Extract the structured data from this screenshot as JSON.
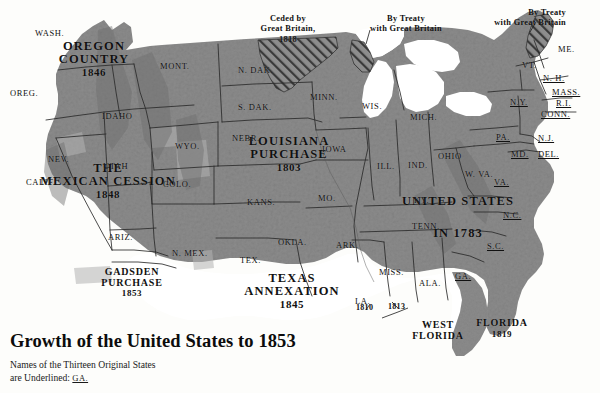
{
  "title": "Growth of the United States to 1853",
  "legend": {
    "line1": "Names of the Thirteen Original States",
    "line2_prefix": "are Underlined:",
    "line2_example": "GA."
  },
  "colors": {
    "land": "#8d8d8d",
    "land_light": "#b0b0b0",
    "water": "#ffffff",
    "paper": "#fdfdfb",
    "border": "#2b2b2b",
    "text": "#111111"
  },
  "territories": [
    {
      "name": "OREGON COUNTRY",
      "line1": "OREGON",
      "line2": "COUNTRY",
      "year": "1846"
    },
    {
      "name": "THE MEXICAN CESSION",
      "line1": "THE",
      "line2": "MEXICAN CESSION",
      "year": "1848"
    },
    {
      "name": "GADSDEN PURCHASE",
      "line1": "GADSDEN",
      "line2": "PURCHASE",
      "year": "1853"
    },
    {
      "name": "LOUISIANA PURCHASE",
      "line1": "LOUISIANA",
      "line2": "PURCHASE",
      "year": "1803"
    },
    {
      "name": "TEXAS ANNEXATION",
      "line1": "TEXAS",
      "line2": "ANNEXATION",
      "year": "1845"
    },
    {
      "name": "UNITED STATES IN 1783",
      "line1": "UNITED STATES",
      "line2": "IN 1783",
      "year": ""
    },
    {
      "name": "WEST FLORIDA",
      "line1": "WEST",
      "line2": "FLORIDA",
      "year": ""
    },
    {
      "name": "FLORIDA",
      "line1": "FLORIDA",
      "line2": "",
      "year": "1819"
    }
  ],
  "annotations": [
    {
      "id": "ceded-britain-1818",
      "line1": "Ceded by",
      "line2": "Great Britain,",
      "year": "1818"
    },
    {
      "id": "treaty-britain-lakes",
      "line1": "By Treaty",
      "line2": "with Great Britain",
      "year": ""
    },
    {
      "id": "treaty-britain-maine",
      "line1": "By Treaty",
      "line2": "with Great Britain",
      "year": ""
    }
  ],
  "west_florida_dates": [
    "1810",
    "1813"
  ],
  "states": [
    {
      "abbr": "WASH.",
      "original": false
    },
    {
      "abbr": "OREG.",
      "original": false
    },
    {
      "abbr": "IDAHO",
      "original": false
    },
    {
      "abbr": "MONT.",
      "original": false
    },
    {
      "abbr": "WYO.",
      "original": false
    },
    {
      "abbr": "NEV.",
      "original": false
    },
    {
      "abbr": "CALIF.",
      "original": false
    },
    {
      "abbr": "UTAH",
      "original": false
    },
    {
      "abbr": "COLO.",
      "original": false
    },
    {
      "abbr": "ARIZ.",
      "original": false
    },
    {
      "abbr": "N. MEX.",
      "original": false
    },
    {
      "abbr": "N. DAK.",
      "original": false
    },
    {
      "abbr": "S. DAK.",
      "original": false
    },
    {
      "abbr": "NEBR.",
      "original": false
    },
    {
      "abbr": "KANS.",
      "original": false
    },
    {
      "abbr": "OKLA.",
      "original": false
    },
    {
      "abbr": "TEX.",
      "original": false
    },
    {
      "abbr": "MINN.",
      "original": false
    },
    {
      "abbr": "IOWA",
      "original": false
    },
    {
      "abbr": "MO.",
      "original": false
    },
    {
      "abbr": "ARK.",
      "original": false
    },
    {
      "abbr": "LA.",
      "original": false
    },
    {
      "abbr": "WIS.",
      "original": false
    },
    {
      "abbr": "ILL.",
      "original": false
    },
    {
      "abbr": "MICH.",
      "original": false
    },
    {
      "abbr": "IND.",
      "original": false
    },
    {
      "abbr": "OHIO",
      "original": false
    },
    {
      "abbr": "KY.",
      "original": false
    },
    {
      "abbr": "TENN.",
      "original": false
    },
    {
      "abbr": "MISS.",
      "original": false
    },
    {
      "abbr": "ALA.",
      "original": false
    },
    {
      "abbr": "W. VA.",
      "original": false
    },
    {
      "abbr": "ME.",
      "original": false
    },
    {
      "abbr": "VT.",
      "original": false
    },
    {
      "abbr": "N. H.",
      "original": true
    },
    {
      "abbr": "MASS.",
      "original": true
    },
    {
      "abbr": "R.I.",
      "original": true
    },
    {
      "abbr": "CONN.",
      "original": true
    },
    {
      "abbr": "N.Y.",
      "original": true
    },
    {
      "abbr": "PA.",
      "original": true
    },
    {
      "abbr": "N.J.",
      "original": true
    },
    {
      "abbr": "MD.",
      "original": true
    },
    {
      "abbr": "DEL.",
      "original": true
    },
    {
      "abbr": "VA.",
      "original": true
    },
    {
      "abbr": "N.C.",
      "original": true
    },
    {
      "abbr": "S.C.",
      "original": true
    },
    {
      "abbr": "GA.",
      "original": true
    }
  ]
}
